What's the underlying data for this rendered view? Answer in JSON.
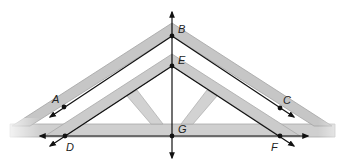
{
  "diagram": {
    "colors": {
      "wood": "#c9c9c9",
      "wood_edge": "#a6a6a6",
      "line": "#111111",
      "background": "#ffffff"
    },
    "points": [
      {
        "id": "A",
        "label": "A",
        "x": 64,
        "y": 107,
        "label_x": 52,
        "label_y": 103
      },
      {
        "id": "B",
        "label": "B",
        "x": 172,
        "y": 36,
        "label_x": 178,
        "label_y": 33
      },
      {
        "id": "C",
        "label": "C",
        "x": 280,
        "y": 108,
        "label_x": 283,
        "label_y": 104
      },
      {
        "id": "D",
        "label": "D",
        "x": 65,
        "y": 136,
        "label_x": 66,
        "label_y": 151
      },
      {
        "id": "E",
        "label": "E",
        "x": 172,
        "y": 66,
        "label_x": 178,
        "label_y": 64
      },
      {
        "id": "F",
        "label": "F",
        "x": 280,
        "y": 136,
        "label_x": 271,
        "label_y": 151
      },
      {
        "id": "G",
        "label": "G",
        "x": 172,
        "y": 136,
        "label_x": 178,
        "label_y": 133
      }
    ],
    "lines": [
      {
        "name": "line-BG-vertical",
        "from": "B",
        "to": "G",
        "arrows": "both"
      },
      {
        "name": "ray-BA",
        "from": "B",
        "through": "A",
        "arrows": "end"
      },
      {
        "name": "ray-BC",
        "from": "B",
        "through": "C",
        "arrows": "end"
      },
      {
        "name": "ray-ED",
        "from": "E",
        "through": "D",
        "arrows": "end"
      },
      {
        "name": "ray-EF",
        "from": "E",
        "through": "F",
        "arrows": "end"
      },
      {
        "name": "line-DF-horizontal",
        "from": "D",
        "to": "F",
        "arrows": "both"
      }
    ]
  }
}
